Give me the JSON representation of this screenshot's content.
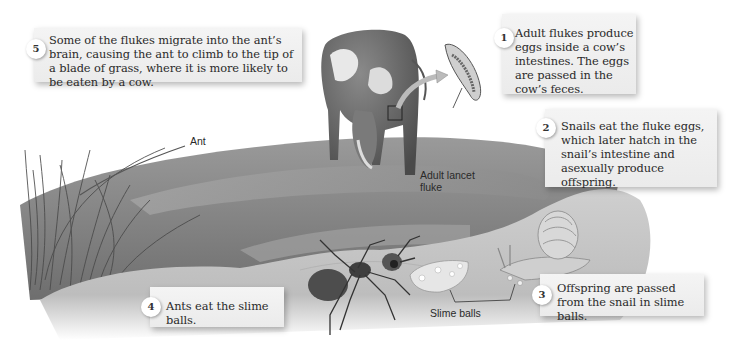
{
  "diagram": {
    "steps": [
      {
        "number": "1",
        "text": "Adult flukes produce eggs inside a cow’s intestines. The eggs are passed in the cow’s feces."
      },
      {
        "number": "2",
        "text": "Snails eat the fluke eggs, which later hatch in the snail’s intestine and asexually produce offspring."
      },
      {
        "number": "3",
        "text": "Offspring are passed from the snail in slime balls."
      },
      {
        "number": "4",
        "text": "Ants eat the slime balls."
      },
      {
        "number": "5",
        "text": "Some of the flukes migrate into the ant’s brain, causing the ant to climb to the tip of a blade of grass, where it is more likely to be eaten by a cow."
      }
    ],
    "labels": {
      "ant": "Ant",
      "fluke": "Adult lancet fluke",
      "slime_balls": "Slime balls"
    },
    "illustrations": [
      "cow-illustration",
      "fluke-illustration",
      "grass-field",
      "ant-illustration",
      "snail-illustration",
      "slime-balls-illustration",
      "ground-mound"
    ],
    "colors": {
      "callout_bg": "#eeeeee",
      "number_circle": "#ffffff",
      "text": "#2a2a2a"
    }
  }
}
